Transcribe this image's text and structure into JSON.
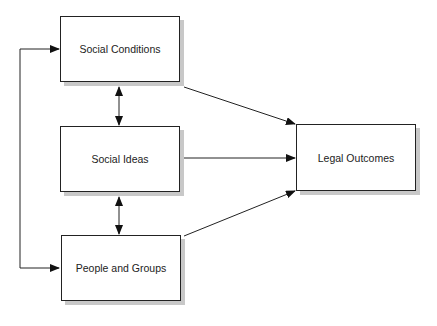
{
  "diagram": {
    "nodes": [
      {
        "id": "social-conditions",
        "label": "Social Conditions"
      },
      {
        "id": "social-ideas",
        "label": "Social Ideas"
      },
      {
        "id": "people-and-groups",
        "label": "People and Groups"
      },
      {
        "id": "legal-outcomes",
        "label": "Legal Outcomes"
      }
    ],
    "edges": [
      {
        "from": "social-conditions",
        "to": "social-ideas",
        "type": "bidirectional"
      },
      {
        "from": "social-ideas",
        "to": "people-and-groups",
        "type": "bidirectional"
      },
      {
        "from": "social-conditions",
        "to": "people-and-groups",
        "type": "bidirectional",
        "route": "left-loop"
      },
      {
        "from": "social-conditions",
        "to": "legal-outcomes",
        "type": "directed"
      },
      {
        "from": "social-ideas",
        "to": "legal-outcomes",
        "type": "directed"
      },
      {
        "from": "people-and-groups",
        "to": "legal-outcomes",
        "type": "directed"
      }
    ],
    "colors": {
      "stroke": "#222222",
      "shadow": "#c8c8c8",
      "fill": "#ffffff"
    }
  }
}
